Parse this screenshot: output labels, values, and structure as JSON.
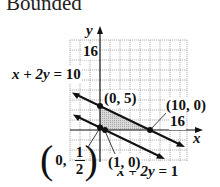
{
  "title": "Bounded",
  "axes": {
    "x_label": "x",
    "y_label": "y",
    "x_tick_label": "16",
    "y_tick_label": "16"
  },
  "lines": [
    {
      "equation": "x + 2y = 10",
      "lhs": "x + 2y",
      "eq": "=",
      "rhs": "10"
    },
    {
      "equation": "x + 2y = 1",
      "lhs": "x + 2y",
      "eq": "=",
      "rhs": "1"
    }
  ],
  "points": [
    {
      "label": "(0, 5)",
      "x": 0,
      "y": 5
    },
    {
      "label": "(10, 0)",
      "x": 10,
      "y": 0
    },
    {
      "label": "(1, 0)",
      "x": 1,
      "y": 0
    },
    {
      "label_prefix": "0,",
      "frac_num": "1",
      "frac_den": "2",
      "x": 0,
      "y": 0.5
    }
  ],
  "colors": {
    "grid": "#9a9a9a",
    "shade": "#c8c8c8",
    "line": "#111111"
  }
}
